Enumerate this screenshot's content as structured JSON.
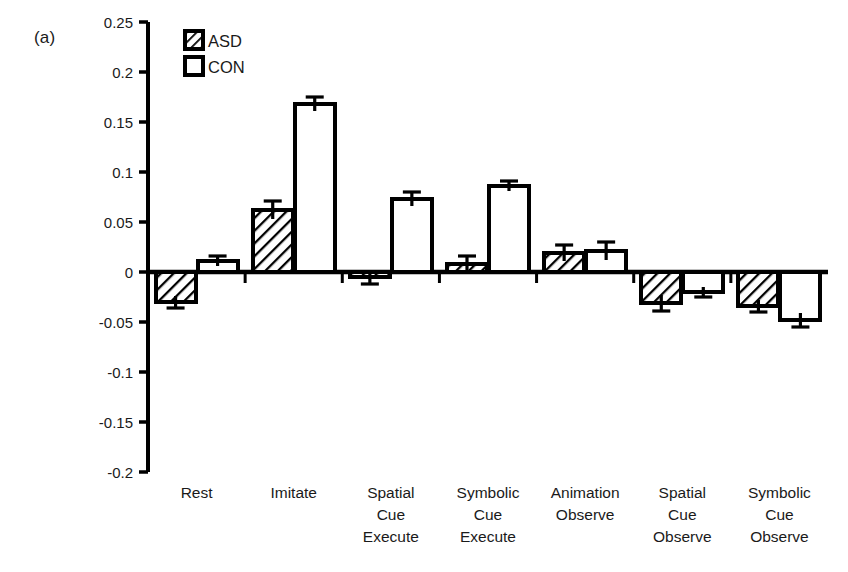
{
  "panel": {
    "label": "(a)"
  },
  "legend": {
    "position": "top-left-inside",
    "entries": [
      {
        "name": "ASD",
        "label": "ASD",
        "swatch": "diagonal-hatch-square",
        "fill": "hatch",
        "stroke": "#000000"
      },
      {
        "name": "CON",
        "label": "CON",
        "swatch": "hollow-square",
        "fill": "#ffffff",
        "stroke": "#000000"
      }
    ]
  },
  "chart_data": {
    "type": "bar",
    "title": "",
    "xlabel": "",
    "ylabel": "",
    "ylim": [
      -0.2,
      0.25
    ],
    "ytick_labels": [
      "0.25",
      "0.2",
      "0.15",
      "0.1",
      "0.05",
      "0",
      "-0.05",
      "-0.1",
      "-0.15",
      "-0.2"
    ],
    "ytick_values": [
      0.25,
      0.2,
      0.15,
      0.1,
      0.05,
      0,
      -0.05,
      -0.1,
      -0.15,
      -0.2
    ],
    "grid": false,
    "zero_line": true,
    "error_bars": "sem",
    "categories": [
      "Rest",
      "Imitate",
      "Spatial Cue Execute",
      "Symbolic Cue Execute",
      "Animation Observe",
      "Spatial Cue Observe",
      "Symbolic Cue Observe"
    ],
    "category_lines": [
      [
        "Rest"
      ],
      [
        "Imitate"
      ],
      [
        "Spatial",
        "Cue",
        "Execute"
      ],
      [
        "Symbolic",
        "Cue",
        "Execute"
      ],
      [
        "Animation",
        "Observe"
      ],
      [
        "Spatial",
        "Cue",
        "Observe"
      ],
      [
        "Symbolic",
        "Cue",
        "Observe"
      ]
    ],
    "series": [
      {
        "name": "ASD",
        "values": [
          -0.03,
          0.062,
          -0.005,
          0.008,
          0.019,
          -0.031,
          -0.034
        ],
        "errors": [
          0.006,
          0.009,
          0.007,
          0.008,
          0.008,
          0.008,
          0.006
        ]
      },
      {
        "name": "CON",
        "values": [
          0.011,
          0.168,
          0.073,
          0.086,
          0.021,
          -0.02,
          -0.048
        ],
        "errors": [
          0.005,
          0.007,
          0.007,
          0.005,
          0.009,
          0.005,
          0.007
        ]
      }
    ]
  },
  "colors": {
    "axis": "#000000",
    "bar_stroke": "#000000",
    "con_fill": "#ffffff",
    "background": "#ffffff"
  }
}
